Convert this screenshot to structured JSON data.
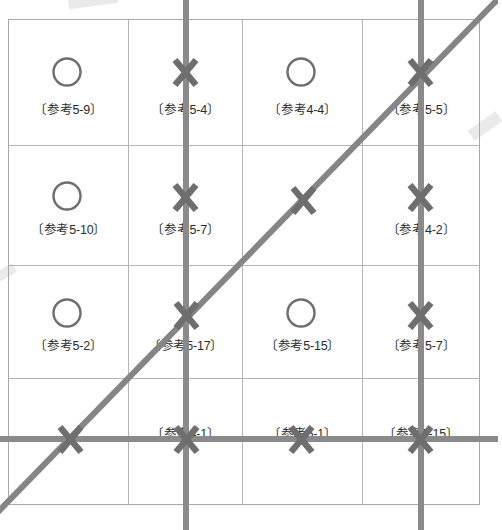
{
  "figure": {
    "type": "diagram",
    "colors": {
      "line_gray": "#808080",
      "mark_gray": "#6e6e6e",
      "grid_border": "#b4b4b4",
      "outer_border": "#a9a9a9",
      "text": "#2b2b2b",
      "background": "#ffffff"
    },
    "grid": {
      "columns": 4,
      "rows": 4
    },
    "cells": [
      {
        "row": 1,
        "col": 1,
        "mark": "circle",
        "label": "〔参考5-9〕"
      },
      {
        "row": 1,
        "col": 2,
        "mark": "cross",
        "label": "〔参考5-4〕"
      },
      {
        "row": 1,
        "col": 3,
        "mark": "circle",
        "label": "〔参考4-4〕"
      },
      {
        "row": 1,
        "col": 4,
        "mark": "cross",
        "label": "〔参考5-5〕"
      },
      {
        "row": 2,
        "col": 1,
        "mark": "circle",
        "label": "〔参考5-10〕"
      },
      {
        "row": 2,
        "col": 2,
        "mark": "cross",
        "label": "〔参考5-7〕"
      },
      {
        "row": 2,
        "col": 3,
        "mark": "cross",
        "label": ""
      },
      {
        "row": 2,
        "col": 4,
        "mark": "cross",
        "label": "〔参考4-2〕"
      },
      {
        "row": 3,
        "col": 1,
        "mark": "circle",
        "label": "〔参考5-2〕"
      },
      {
        "row": 3,
        "col": 2,
        "mark": "cross",
        "label": "〔参考5-17〕"
      },
      {
        "row": 3,
        "col": 3,
        "mark": "circle",
        "label": "〔参考5-15〕"
      },
      {
        "row": 3,
        "col": 4,
        "mark": "cross",
        "label": "〔参考5-7〕"
      },
      {
        "row": 4,
        "col": 1,
        "mark": "cross",
        "label": ""
      },
      {
        "row": 4,
        "col": 2,
        "mark": "cross",
        "label": "〔参考4-1〕"
      },
      {
        "row": 4,
        "col": 3,
        "mark": "cross",
        "label": "〔参考5-1〕"
      },
      {
        "row": 4,
        "col": 4,
        "mark": "cross",
        "label": "〔参考5-15〕"
      }
    ],
    "lines": [
      {
        "name": "vertical-line-left",
        "orientation": "vertical",
        "x": 186
      },
      {
        "name": "vertical-line-right",
        "orientation": "vertical",
        "x": 421
      },
      {
        "name": "horizontal-line",
        "orientation": "horizontal",
        "y": 439
      },
      {
        "name": "diagonal-line",
        "orientation": "diagonal",
        "from": [
          -4,
          514
        ],
        "to": [
          498,
          -2
        ]
      }
    ]
  }
}
